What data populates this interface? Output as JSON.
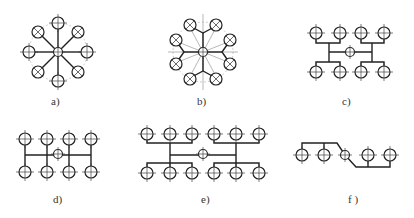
{
  "figure": {
    "panels": [
      {
        "id": "a",
        "label": "a)",
        "layout": "radial star, 8 outlets with central hub, straight spokes"
      },
      {
        "id": "b",
        "label": "b)",
        "layout": "radial, 8 outlets in 4 pairs, Y-branch to central hub"
      },
      {
        "id": "c",
        "label": "c)",
        "layout": "H-tree, 8 outlets, central hub"
      },
      {
        "id": "d",
        "label": "d)",
        "layout": "comb, 8 outlets in 2 rows, central hub on main line"
      },
      {
        "id": "e",
        "label": "e)",
        "layout": "H-tree, 12 outlets in 2 rows, central hub"
      },
      {
        "id": "f",
        "label": "f )",
        "layout": "in-line, 5 outlets, central hub with offset branches"
      }
    ]
  },
  "colors": {
    "stroke": "#222222",
    "construction": "#999999",
    "label": "#333333"
  }
}
